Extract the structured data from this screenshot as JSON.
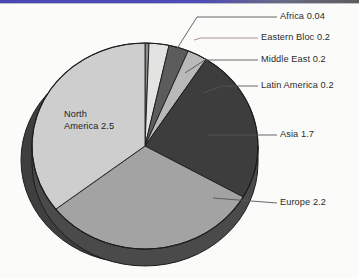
{
  "decor": {
    "top_band_name": "top-accent-band",
    "band_color_left": "#4a46b4",
    "band_color_right": "#5d5d5d"
  },
  "chart_data": {
    "type": "pie",
    "title": "",
    "subtitle": "",
    "xlabel": "",
    "ylabel": "",
    "grid": false,
    "legend_position": "callout-labels-right",
    "three_d": true,
    "total": 7.04,
    "start_angle_deg": 0,
    "direction": "clockwise",
    "categories": [
      "Africa",
      "Eastern Bloc",
      "Middle East",
      "Latin America",
      "Asia",
      "Europe",
      "North America"
    ],
    "values": [
      0.04,
      0.2,
      0.2,
      0.2,
      1.7,
      2.2,
      2.5
    ],
    "labels": [
      "Africa 0.04",
      "Eastern Bloc 0.2",
      "Middle East 0.2",
      "Latin America 0.2",
      "Asia 1.7",
      "Europe 2.2",
      "North America 2.5"
    ],
    "annotations": [
      {
        "text": "North America 2.5",
        "placement": "inside-slice",
        "lines": [
          "North",
          "America 2.5"
        ]
      }
    ],
    "slices": [
      {
        "name": "Africa",
        "label": "Africa 0.04",
        "value": 0.04,
        "color": "#8c8c8c",
        "start_deg": 0,
        "sweep_deg": 2.05,
        "label_x": 281,
        "label_y": 14,
        "leader": "callout"
      },
      {
        "name": "Eastern Bloc",
        "label": "Eastern Bloc 0.2",
        "value": 0.2,
        "color": "#e3e3e1",
        "start_deg": 2.05,
        "sweep_deg": 10.23,
        "label_x": 262,
        "label_y": 38,
        "leader": "callout"
      },
      {
        "name": "Middle East",
        "label": "Middle East 0.2",
        "value": 0.2,
        "color": "#5c5c5c",
        "start_deg": 12.28,
        "sweep_deg": 10.23,
        "label_x": 262,
        "label_y": 57,
        "leader": "callout"
      },
      {
        "name": "Latin America",
        "label": "Latin America 0.2",
        "value": 0.2,
        "color": "#b9b9b9",
        "start_deg": 22.51,
        "sweep_deg": 10.23,
        "label_x": 262,
        "label_y": 83,
        "leader": "callout"
      },
      {
        "name": "Asia",
        "label": "Asia 1.7",
        "value": 1.7,
        "color": "#3d3d3d",
        "start_deg": 32.74,
        "sweep_deg": 86.93,
        "label_x": 281,
        "label_y": 131,
        "leader": "callout"
      },
      {
        "name": "Europe",
        "label": "Europe 2.2",
        "value": 2.2,
        "color": "#a3a3a3",
        "start_deg": 119.67,
        "sweep_deg": 112.5,
        "label_x": 281,
        "label_y": 200,
        "leader": "callout"
      },
      {
        "name": "North America",
        "label": "North America 2.5",
        "value": 2.5,
        "color": "#cecece",
        "start_deg": 232.17,
        "sweep_deg": 127.83,
        "label_x": 66,
        "label_y": 117,
        "leader": "inside"
      }
    ],
    "geometry": {
      "center_x": 145,
      "center_y": 146,
      "radius_x": 113,
      "radius_y": 103,
      "depth": 17,
      "shadow_color": "#3f3f3f",
      "shadow_offset_x": -11,
      "shadow_offset_y": 14
    },
    "colors": {
      "background": "#fbfbf9",
      "outline": "#1d1d1d",
      "leader_line": "#55555a",
      "leader_line_eastern_bloc": "#9e8a86",
      "text": "#2b2b2b"
    }
  },
  "inside_label": {
    "line1": "North",
    "line2": "America 2.5"
  },
  "callouts": {
    "africa": "Africa 0.04",
    "eastern_bloc": "Eastern Bloc 0.2",
    "middle_east": "Middle East 0.2",
    "latin_america": "Latin America 0.2",
    "asia": "Asia 1.7",
    "europe": "Europe 2.2"
  }
}
